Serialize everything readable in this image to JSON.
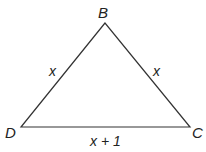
{
  "diagram": {
    "type": "triangle",
    "stroke_color": "#333333",
    "vertices": {
      "B": {
        "label": "B",
        "x": 105,
        "y": 23
      },
      "D": {
        "label": "D",
        "x": 21,
        "y": 127
      },
      "C": {
        "label": "C",
        "x": 190,
        "y": 127
      }
    },
    "sides": {
      "DB": {
        "label": "x"
      },
      "BC": {
        "label": "x"
      },
      "DC": {
        "label": "x + 1"
      }
    }
  }
}
